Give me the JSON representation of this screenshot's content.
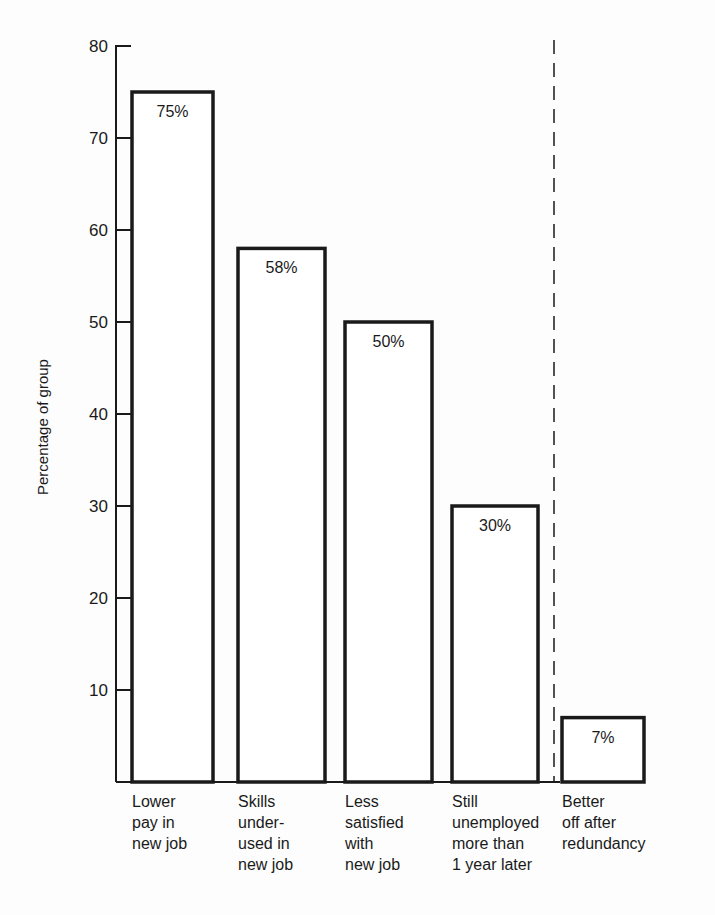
{
  "chart_data": {
    "type": "bar",
    "title": "",
    "xlabel": "",
    "ylabel": "Percentage of group",
    "ylim": [
      0,
      80
    ],
    "yticks": [
      10,
      20,
      30,
      40,
      50,
      60,
      70,
      80
    ],
    "grid": false,
    "categories": [
      "Lower pay in new job",
      "Skills under-used in new job",
      "Less satisfied with new job",
      "Still unemployed more than 1 year later",
      "Better off after redundancy"
    ],
    "category_lines": [
      "Lower\npay in\nnew job",
      "Skills\nunder-\nused in\nnew job",
      "Less\nsatisfied\nwith\nnew job",
      "Still\nunemployed\nmore than\n1 year later",
      "Better\noff after\nredundancy"
    ],
    "values": [
      75,
      58,
      50,
      30,
      7
    ],
    "value_labels": [
      "75%",
      "58%",
      "50%",
      "30%",
      "7%"
    ],
    "annotations": [
      "dashed vertical separator before 'Better off after redundancy'"
    ]
  }
}
